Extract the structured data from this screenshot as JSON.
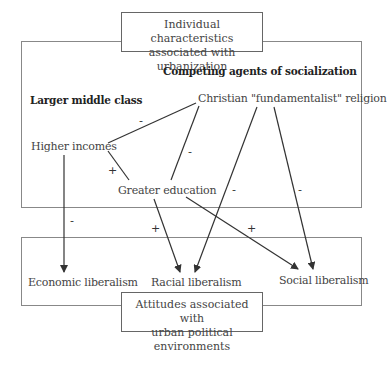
{
  "title_top": {
    "line1": "Individual characteristics",
    "line2": "associated with urbanization"
  },
  "title_bottom": {
    "line1": "Attitudes associated with",
    "line2": "urban political environments"
  },
  "headings": {
    "left": "Larger middle class",
    "right": "Competing agents of socialization"
  },
  "nodes": {
    "religion": "Christian \"fundamentalist\" religion",
    "income": "Higher incomes",
    "education": "Greater education",
    "economic": "Economic liberalism",
    "racial": "Racial liberalism",
    "social": "Social liberalism"
  },
  "edges": [
    {
      "from": "religion",
      "to": "income",
      "sign": "-"
    },
    {
      "from": "religion",
      "to": "education",
      "sign": "-"
    },
    {
      "from": "income",
      "to": "education",
      "sign": "+"
    },
    {
      "from": "income",
      "to": "economic",
      "sign": "-"
    },
    {
      "from": "education",
      "to": "racial",
      "sign": "+"
    },
    {
      "from": "religion",
      "to": "racial",
      "sign": "-"
    },
    {
      "from": "education",
      "to": "social",
      "sign": "+"
    },
    {
      "from": "religion",
      "to": "social",
      "sign": "-"
    }
  ],
  "signs": {
    "s1": "-",
    "s2": "-",
    "s3": "+",
    "s4": "-",
    "s5": "+",
    "s6": "-",
    "s7": "+",
    "s8": "-"
  },
  "colors": {
    "line": "#333333",
    "box_border": "#777777"
  }
}
